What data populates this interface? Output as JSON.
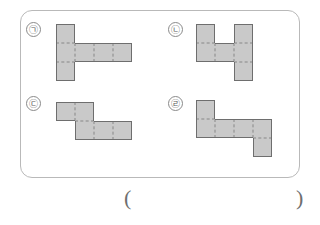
{
  "worksheet": {
    "title": "cube-net-multiple-choice",
    "frame_border_color": "#b9b9b9",
    "cell_fill_color": "#c9c9c9",
    "cell_edge_color": "#6e6e6e",
    "fold_line_color": "#a8a8a8"
  },
  "options": [
    {
      "key": "a",
      "label": "ㄱ",
      "label_full": "㉠",
      "cells": [
        {
          "col": 0,
          "row": 0
        },
        {
          "col": 0,
          "row": 1
        },
        {
          "col": 0,
          "row": 2
        },
        {
          "col": 1,
          "row": 1
        },
        {
          "col": 2,
          "row": 1
        },
        {
          "col": 3,
          "row": 1
        }
      ],
      "cell_count": 6
    },
    {
      "key": "b",
      "label": "ㄴ",
      "label_full": "㉡",
      "cells": [
        {
          "col": 0,
          "row": 0
        },
        {
          "col": 2,
          "row": 0
        },
        {
          "col": 0,
          "row": 1
        },
        {
          "col": 1,
          "row": 1
        },
        {
          "col": 2,
          "row": 1
        },
        {
          "col": 2,
          "row": 2
        }
      ],
      "cell_count": 6
    },
    {
      "key": "c",
      "label": "ㄷ",
      "label_full": "㉢",
      "cells": [
        {
          "col": 0,
          "row": 0
        },
        {
          "col": 1,
          "row": 0
        },
        {
          "col": 1,
          "row": 1
        },
        {
          "col": 2,
          "row": 1
        },
        {
          "col": 3,
          "row": 1
        }
      ],
      "cell_count": 5
    },
    {
      "key": "d",
      "label": "ㄹ",
      "label_full": "㉣",
      "cells": [
        {
          "col": 0,
          "row": 0
        },
        {
          "col": 0,
          "row": 1
        },
        {
          "col": 1,
          "row": 1
        },
        {
          "col": 2,
          "row": 1
        },
        {
          "col": 3,
          "row": 1
        },
        {
          "col": 3,
          "row": 2
        }
      ],
      "cell_count": 6
    }
  ],
  "answer": {
    "open_paren": "(",
    "close_paren": ")",
    "value": ""
  }
}
